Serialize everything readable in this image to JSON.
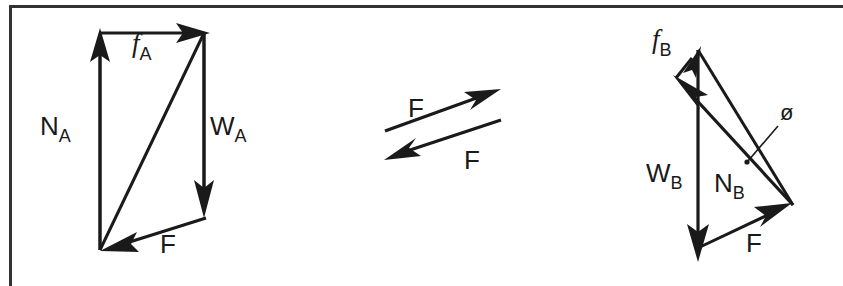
{
  "figure": {
    "background_color": "#ffffff",
    "stroke_color": "#1a1a1a",
    "frame": {
      "name": "figure-border",
      "left": 9,
      "top": 5,
      "border_width": 3,
      "note": "Top border spans full width; left border visible; bottom and right cropped"
    },
    "diagrams": [
      {
        "id": "block-a",
        "name": "force-triangle-a",
        "labels": [
          {
            "id": "na",
            "text": "N",
            "subscript": "A",
            "italic": false,
            "x": 40,
            "y": 135
          },
          {
            "id": "fa",
            "text": "f",
            "subscript": "A",
            "italic": true,
            "x": 132,
            "y": 52
          },
          {
            "id": "wa",
            "text": "W",
            "subscript": "A",
            "italic": false,
            "x": 210,
            "y": 135
          },
          {
            "id": "fres",
            "text": "F",
            "subscript": "",
            "italic": false,
            "x": 160,
            "y": 253
          }
        ],
        "vectors": [
          {
            "id": "na-vector",
            "label": "N_A",
            "x1": 100,
            "y1": 250,
            "x2": 100,
            "y2": 33
          },
          {
            "id": "fa-vector",
            "label": "f_A",
            "x1": 100,
            "y1": 33,
            "x2": 204,
            "y2": 33
          },
          {
            "id": "wa-vector",
            "label": "W_A",
            "x1": 204,
            "y1": 33,
            "x2": 204,
            "y2": 200
          },
          {
            "id": "f-vector-a",
            "label": "F",
            "x1": 204,
            "y1": 218,
            "x2": 104,
            "y2": 250
          },
          {
            "id": "resultant-a",
            "label": "resultant",
            "x1": 100,
            "y1": 250,
            "x2": 204,
            "y2": 33
          }
        ]
      },
      {
        "id": "middle-pair",
        "name": "action-reaction-pair",
        "labels": [
          {
            "id": "f-upper",
            "text": "F",
            "subscript": "",
            "italic": false,
            "x": 416,
            "y": 110
          },
          {
            "id": "f-lower",
            "text": "F",
            "subscript": "",
            "italic": false,
            "x": 470,
            "y": 162
          }
        ],
        "vectors": [
          {
            "id": "f-vector-up",
            "label": "F",
            "x1": 385,
            "y1": 131,
            "x2": 497,
            "y2": 91
          },
          {
            "id": "f-vector-down",
            "label": "F",
            "x1": 499,
            "y1": 121,
            "x2": 387,
            "y2": 158
          }
        ]
      },
      {
        "id": "block-b",
        "name": "force-triangle-b",
        "labels": [
          {
            "id": "fb",
            "text": "f",
            "subscript": "B",
            "italic": true,
            "x": 652,
            "y": 48
          },
          {
            "id": "wb",
            "text": "W",
            "subscript": "B",
            "italic": false,
            "x": 651,
            "y": 182
          },
          {
            "id": "nb",
            "text": "N",
            "subscript": "B",
            "italic": false,
            "x": 717,
            "y": 190
          },
          {
            "id": "f-b",
            "text": "F",
            "subscript": "",
            "italic": false,
            "x": 752,
            "y": 246
          },
          {
            "id": "phi",
            "text": "ø",
            "subscript": "",
            "italic": false,
            "x": 785,
            "y": 115
          }
        ],
        "vectors": [
          {
            "id": "fb-vector",
            "label": "f_B",
            "x1": 676,
            "y1": 76,
            "x2": 698,
            "y2": 50
          },
          {
            "id": "wb-vector",
            "label": "W_B",
            "x1": 698,
            "y1": 50,
            "x2": 698,
            "y2": 245
          },
          {
            "id": "nb-vector",
            "label": "N_B",
            "x1": 793,
            "y1": 205,
            "x2": 676,
            "y2": 78
          },
          {
            "id": "f-vector-b",
            "label": "F",
            "x1": 700,
            "y1": 247,
            "x2": 790,
            "y2": 203
          },
          {
            "id": "hyp-b",
            "label": "hypotenuse",
            "x1": 698,
            "y1": 50,
            "x2": 793,
            "y2": 205
          }
        ],
        "leader": {
          "id": "phi-leader",
          "x1": 776,
          "y1": 128,
          "x2": 746,
          "y2": 163
        }
      }
    ]
  }
}
